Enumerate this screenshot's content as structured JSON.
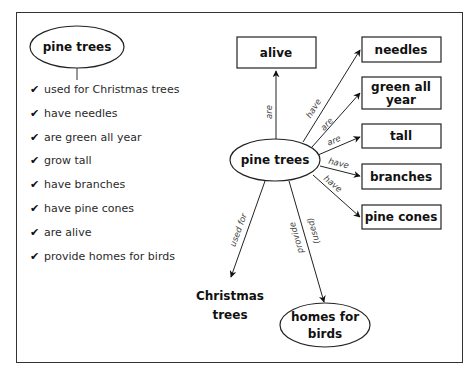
{
  "left_panel": {
    "title": "pine trees",
    "facts": [
      "used for Christmas trees",
      "have needles",
      "are green all year",
      "grow tall",
      "have branches",
      "have pine cones",
      "are alive",
      "provide homes for birds"
    ],
    "check_glyph": "✔"
  },
  "diagram": {
    "center": "pine trees",
    "nodes": {
      "alive": "alive",
      "needles": "needles",
      "green_line1": "green all",
      "green_line2": "year",
      "tall": "tall",
      "branches": "branches",
      "pine_cones": "pine cones",
      "christmas_line1": "Christmas",
      "christmas_line2": "trees",
      "homes_line1": "homes for",
      "homes_line2": "birds"
    },
    "edges": {
      "alive": "are",
      "needles": "have",
      "green": "are",
      "tall": "are",
      "branches": "have",
      "pine_cones": "have",
      "christmas": "used for",
      "homes_a": "provide",
      "homes_b": "(used)"
    }
  }
}
